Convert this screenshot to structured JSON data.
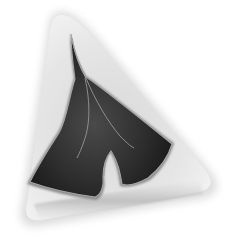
{
  "image": {
    "description": "Grayscale photograph of a ginkgo leaf embedded in a translucent triangular resin block",
    "subject": "ginkgo-leaf",
    "container": "resin-block",
    "colors": {
      "background": "#ffffff",
      "resin": "#e4e4e4",
      "resin_edge": "#bdbdbd",
      "leaf_dark": "#1c1c1c",
      "leaf_mid": "#3a3a3a",
      "leaf_outline": "#9a9a9a"
    }
  }
}
